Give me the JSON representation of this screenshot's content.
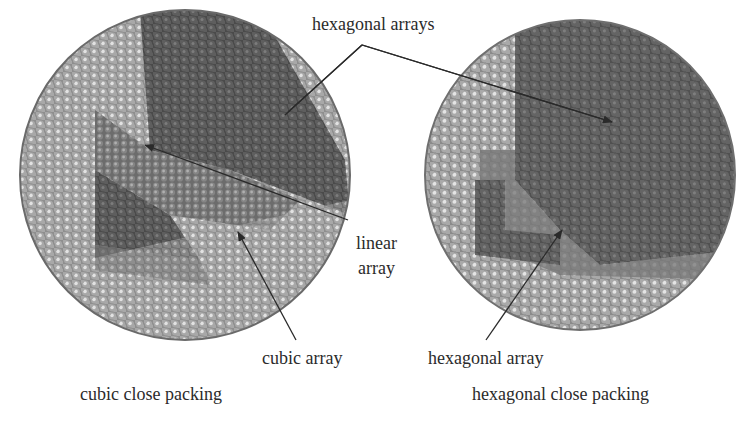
{
  "figure": {
    "labels": {
      "hexagonal_arrays": "hexagonal arrays",
      "linear_array_line1": "linear",
      "linear_array_line2": "array",
      "cubic_array": "cubic array",
      "hexagonal_array": "hexagonal array",
      "left_caption": "cubic close packing",
      "right_caption": "hexagonal close packing"
    },
    "panels": [
      {
        "name": "cubic close packing cluster",
        "center": [
          185,
          175
        ],
        "radius": 165
      },
      {
        "name": "hexagonal close packing cluster",
        "center": [
          580,
          175
        ],
        "radius": 155
      }
    ],
    "colors": {
      "background": "#ffffff",
      "sphere_light": "#c9c9c9",
      "sphere_mid": "#8c8c8c",
      "sphere_dark": "#5a5a5a",
      "sphere_darkest": "#3f3f3f",
      "atom_highlight": "#e6e6e6",
      "arrow": "#2a2a2a",
      "text": "#2b2b2b"
    }
  }
}
